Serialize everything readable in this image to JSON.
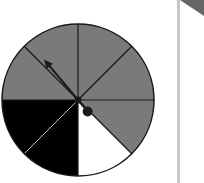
{
  "diagram": {
    "type": "spinner",
    "center": [
      78,
      100
    ],
    "radius": 76,
    "sectors": [
      {
        "start": 180,
        "end": 225,
        "color": "#7a7a7a",
        "label": "gray"
      },
      {
        "start": 225,
        "end": 270,
        "color": "#7a7a7a",
        "label": "gray"
      },
      {
        "start": 270,
        "end": 315,
        "color": "#7a7a7a",
        "label": "gray"
      },
      {
        "start": 315,
        "end": 360,
        "color": "#7a7a7a",
        "label": "gray"
      },
      {
        "start": 0,
        "end": 45,
        "color": "#7a7a7a",
        "label": "gray"
      },
      {
        "start": 45,
        "end": 90,
        "color": "#ffffff",
        "label": "white"
      },
      {
        "start": 90,
        "end": 135,
        "color": "#000000",
        "label": "black"
      },
      {
        "start": 135,
        "end": 180,
        "color": "#000000",
        "label": "black"
      }
    ],
    "pointer": {
      "angle_deg": 230,
      "length": 50,
      "color": "#1a1a1a"
    },
    "colors": {
      "gray": "#7a7a7a",
      "black": "#000000",
      "white": "#ffffff",
      "outline": "#1a1a1a",
      "divider_on_black": "#bbbbbb",
      "panel_separator": "#c8c8c8"
    }
  }
}
